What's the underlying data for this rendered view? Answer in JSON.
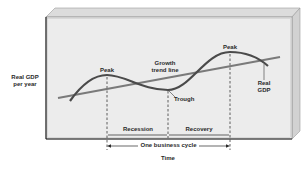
{
  "diagram": {
    "type": "business-cycle",
    "y_axis_label_line1": "Real GDP",
    "y_axis_label_line2": "per year",
    "x_axis_label": "Time",
    "labels": {
      "peak_left": "Peak",
      "peak_right": "Peak",
      "trough": "Trough",
      "trend_line_1": "Growth",
      "trend_line_2": "trend line",
      "real_gdp_1": "Real",
      "real_gdp_2": "GDP",
      "recession": "Recession",
      "recovery": "Recovery",
      "business_cycle": "One business cycle"
    },
    "colors": {
      "panel_face": "#ececec",
      "panel_top": "#d8d8d8",
      "panel_side": "#cfcfcf",
      "curve": "#4a4a4a",
      "trend": "#7a7a7a",
      "border": "#1a1a1a"
    }
  }
}
